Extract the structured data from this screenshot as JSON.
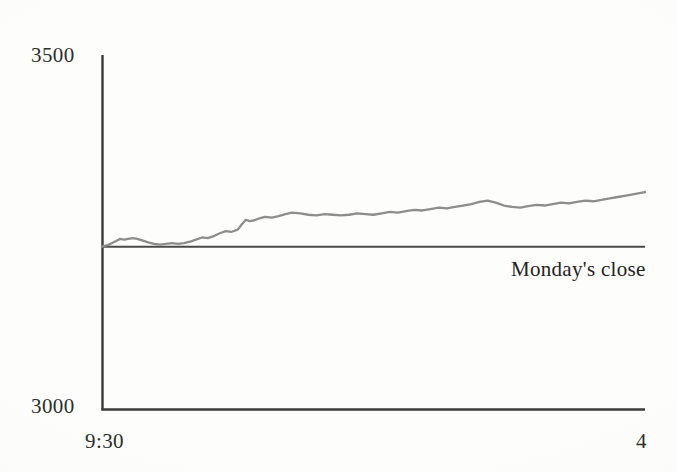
{
  "figure": {
    "background_color": "#fdfdfc",
    "axis_color": "#3a3a38",
    "series_color": "#8d8d8a",
    "reference_line_color": "#4a4a48",
    "text_color": "#2e2e2c"
  },
  "labels": {
    "y_max": "3500",
    "y_min": "3000",
    "x_start": "9:30",
    "x_end": "4",
    "reference_line": "Monday's close"
  },
  "chart_data": {
    "type": "line",
    "title": "",
    "subtitle": "",
    "xlabel": "",
    "ylabel": "",
    "xlim": [
      "9:30",
      "4"
    ],
    "ylim": [
      3000,
      3500
    ],
    "yticks": [
      3000,
      3500
    ],
    "ytick_labels": [
      "3000",
      "3500"
    ],
    "xticks": [
      "9:30",
      "4"
    ],
    "xtick_labels": [
      "9:30",
      "4"
    ],
    "grid": false,
    "legend": false,
    "annotations": [
      {
        "text": "Monday's close",
        "x_fraction": 0.755,
        "y_value": 3207,
        "describes": "horizontal reference line marking previous session's closing level"
      }
    ],
    "reference_lines": [
      {
        "name": "Monday's close",
        "orientation": "horizontal",
        "y_value": 3230,
        "color": "#4a4a48"
      }
    ],
    "series": [
      {
        "name": "Index level",
        "color": "#8d8d8a",
        "x": [
          0.0,
          0.013,
          0.026,
          0.033,
          0.041,
          0.048,
          0.057,
          0.065,
          0.074,
          0.085,
          0.096,
          0.107,
          0.118,
          0.129,
          0.14,
          0.151,
          0.162,
          0.173,
          0.184,
          0.195,
          0.206,
          0.217,
          0.228,
          0.239,
          0.25,
          0.258,
          0.265,
          0.272,
          0.28,
          0.29,
          0.3,
          0.313,
          0.325,
          0.338,
          0.35,
          0.365,
          0.38,
          0.395,
          0.41,
          0.425,
          0.44,
          0.455,
          0.47,
          0.485,
          0.5,
          0.515,
          0.53,
          0.545,
          0.56,
          0.575,
          0.59,
          0.605,
          0.62,
          0.635,
          0.65,
          0.665,
          0.68,
          0.695,
          0.71,
          0.725,
          0.74,
          0.755,
          0.77,
          0.785,
          0.8,
          0.815,
          0.83,
          0.845,
          0.86,
          0.875,
          0.89,
          0.905,
          0.92,
          0.935,
          0.95,
          0.965,
          0.98,
          1.0
        ],
        "y": [
          3230,
          3233,
          3238,
          3241,
          3240,
          3241,
          3242,
          3241,
          3239,
          3236,
          3234,
          3233,
          3234,
          3235,
          3234,
          3235,
          3237,
          3240,
          3243,
          3242,
          3245,
          3249,
          3252,
          3251,
          3254,
          3262,
          3268,
          3266,
          3267,
          3270,
          3272,
          3271,
          3273,
          3276,
          3278,
          3277,
          3275,
          3274,
          3276,
          3275,
          3274,
          3275,
          3277,
          3276,
          3275,
          3277,
          3279,
          3278,
          3280,
          3282,
          3281,
          3283,
          3285,
          3284,
          3286,
          3288,
          3290,
          3293,
          3295,
          3292,
          3288,
          3286,
          3285,
          3287,
          3289,
          3288,
          3290,
          3292,
          3291,
          3293,
          3295,
          3294,
          3296,
          3298,
          3300,
          3302,
          3304,
          3307
        ]
      }
    ]
  },
  "geometry": {
    "plot_left_px": 102,
    "plot_right_px": 645,
    "plot_top_px": 55,
    "plot_bottom_px": 410
  }
}
